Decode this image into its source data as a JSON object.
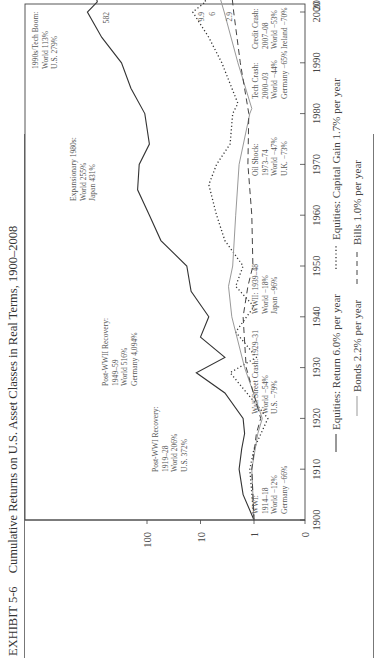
{
  "exhibit": {
    "number": "EXHIBIT 5-6",
    "title": "Cumulative Returns on U.S. Asset Classes in Real Terms, 1900–2008"
  },
  "chart_data": {
    "type": "line",
    "title": "Cumulative Returns on U.S. Asset Classes in Real Terms, 1900–2008",
    "xlabel": "",
    "ylabel": "",
    "yscale": "log",
    "x_ticks": [
      "1900",
      "1910",
      "1920",
      "1930",
      "1940",
      "1950",
      "1960",
      "1970",
      "1980",
      "1990",
      "2000",
      "2008"
    ],
    "y_ticks": [
      "0",
      "1",
      "10",
      "100"
    ],
    "xlim": [
      1900,
      2008
    ],
    "ylim": [
      0.1,
      1000
    ],
    "grid": false,
    "orientation": "rotated 90 degrees counter-clockwise on page",
    "series": [
      {
        "name": "Equities: Return 6.0% per year",
        "style": "solid-dark",
        "end_value": 582,
        "x": [
          1900,
          1905,
          1910,
          1914,
          1917,
          1920,
          1925,
          1929,
          1932,
          1936,
          1940,
          1945,
          1950,
          1955,
          1960,
          1965,
          1970,
          1974,
          1980,
          1985,
          1990,
          1995,
          2000,
          2002,
          2007,
          2008
        ],
        "values": [
          1,
          1.6,
          1.9,
          1.7,
          1.5,
          1.6,
          3.5,
          12,
          3.5,
          10,
          7,
          15,
          18,
          55,
          90,
          150,
          140,
          90,
          110,
          200,
          300,
          700,
          1300,
          850,
          1100,
          582
        ]
      },
      {
        "name": "Equities: Capital Gain 1.7% per year",
        "style": "dotted",
        "end_value": 9.9,
        "x": [
          1900,
          1910,
          1914,
          1920,
          1929,
          1932,
          1937,
          1942,
          1946,
          1950,
          1955,
          1960,
          1966,
          1970,
          1974,
          1980,
          1982,
          1990,
          1995,
          2000,
          2002,
          2007,
          2008
        ],
        "values": [
          1,
          1.2,
          1.0,
          0.55,
          2.8,
          0.9,
          2.2,
          1.0,
          2.2,
          1.6,
          3.5,
          5,
          7,
          5,
          2.8,
          2.5,
          2.0,
          4,
          7,
          14,
          8,
          12,
          9.9
        ]
      },
      {
        "name": "Bonds 2.2% per year",
        "style": "solid-light",
        "end_value": 6.0,
        "x": [
          1900,
          1910,
          1917,
          1920,
          1930,
          1940,
          1946,
          1950,
          1960,
          1970,
          1980,
          1981,
          1990,
          2000,
          2008
        ],
        "values": [
          1,
          1.1,
          0.85,
          0.7,
          1.5,
          2.6,
          3.0,
          2.5,
          2.2,
          1.9,
          1.2,
          1.1,
          2.0,
          3.6,
          6.0
        ]
      },
      {
        "name": "Bills 1.0% per year",
        "style": "dashed",
        "end_value": 2.9,
        "x": [
          1900,
          1910,
          1917,
          1920,
          1930,
          1940,
          1946,
          1950,
          1960,
          1970,
          1980,
          1990,
          2000,
          2008
        ],
        "values": [
          1,
          1.1,
          0.9,
          0.75,
          1.4,
          1.6,
          1.3,
          1.05,
          1.1,
          1.3,
          1.25,
          1.8,
          2.4,
          2.9
        ]
      }
    ],
    "end_labels": [
      "582",
      "9.9",
      "6.0",
      "2.9"
    ],
    "annotations": [
      {
        "id": "wwi",
        "lines": [
          "WWI:",
          "1914–18",
          "World −12%",
          "Germany −66%"
        ]
      },
      {
        "id": "post_wwi",
        "lines": [
          "Post-WWI Recovery:",
          "1919–28",
          "World 206%",
          "U.S. 372%"
        ]
      },
      {
        "id": "wall_street",
        "lines": [
          "Wall Street Crash: 1929–31",
          "World −54%",
          "U.S. −79%"
        ]
      },
      {
        "id": "wwii",
        "lines": [
          "WWII: 1939–48",
          "World −18%",
          "Japan −96%"
        ]
      },
      {
        "id": "post_wwii",
        "lines": [
          "Post-WWII Recovery:",
          "1949–59",
          "World 516%",
          "Germany 4,094%"
        ]
      },
      {
        "id": "expansionary_1980s",
        "lines": [
          "Expansionary 1980s:",
          "World 255%",
          "Japan 431%"
        ]
      },
      {
        "id": "oil_shock",
        "lines": [
          "Oil Shock:",
          "1973–74",
          "World −47%",
          "U.K. −73%"
        ]
      },
      {
        "id": "tech_crash",
        "lines": [
          "Tech Crash:",
          "2000–03",
          "World −44%",
          "Germany −65%"
        ]
      },
      {
        "id": "tech_boom",
        "lines": [
          "1990s/Tech Boom:",
          "World 113%",
          "U.S. 279%"
        ]
      },
      {
        "id": "credit_crash",
        "lines": [
          "Credit Crash:",
          "2007–08",
          "World −53%",
          "Ireland −70%"
        ]
      }
    ],
    "legend": {
      "position": "bottom",
      "row1": [
        "Equities: Return 6.0% per year",
        "Equities: Capital Gain 1.7% per year"
      ],
      "row2": [
        "Bonds 2.2% per year",
        "Bills 1.0% per year"
      ]
    }
  }
}
